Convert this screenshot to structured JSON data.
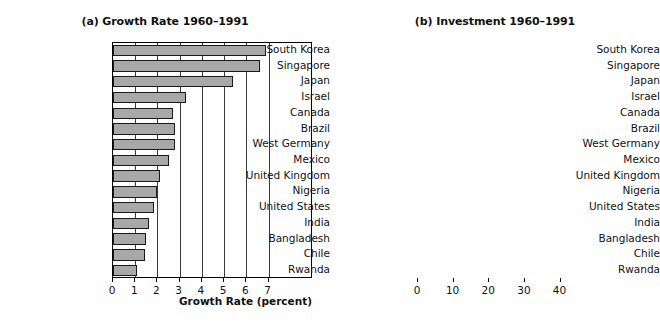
{
  "figure": {
    "background_color": "#ffffff",
    "panel_a_bar_color": "#a8a8a8",
    "panel_b_bar_color": "#e4e4e4"
  },
  "panels": {
    "a": {
      "title": "(a) Growth Rate 1960–1991",
      "xlabel": "Growth Rate (percent)",
      "ticks": [
        "0",
        "1",
        "2",
        "3",
        "4",
        "5",
        "6",
        "7"
      ]
    },
    "b": {
      "title": "(b) Investment 1960–1991",
      "xlabel": "Investment (percent of GDP)",
      "ticks": [
        "0",
        "10",
        "20",
        "30",
        "40"
      ]
    }
  },
  "chart_data": [
    {
      "type": "bar",
      "orientation": "horizontal",
      "title": "(a) Growth Rate 1960–1991",
      "xlabel": "Growth Rate (percent)",
      "ylabel": "",
      "xlim": [
        0,
        9
      ],
      "xticks": [
        0,
        1,
        2,
        3,
        4,
        5,
        6,
        7
      ],
      "grid": "vertical",
      "legend": "none",
      "bar_color": "#a8a8a8",
      "categories": [
        "South Korea",
        "Singapore",
        "Japan",
        "Israel",
        "Canada",
        "Brazil",
        "West Germany",
        "Mexico",
        "United Kingdom",
        "Nigeria",
        "United States",
        "India",
        "Bangladesh",
        "Chile",
        "Rwanda"
      ],
      "values": [
        6.9,
        6.6,
        5.4,
        3.3,
        2.7,
        2.8,
        2.8,
        2.5,
        2.1,
        2.0,
        1.85,
        1.6,
        1.5,
        1.45,
        1.1
      ]
    },
    {
      "type": "bar",
      "orientation": "horizontal",
      "title": "(b) Investment 1960–1991",
      "xlabel": "Investment (percent of GDP)",
      "ylabel": "",
      "xlim": [
        0,
        55
      ],
      "xticks": [
        0,
        10,
        20,
        30,
        40
      ],
      "grid": "vertical",
      "legend": "none",
      "bar_color": "#e4e4e4",
      "categories": [
        "South Korea",
        "Singapore",
        "Japan",
        "Israel",
        "Canada",
        "Brazil",
        "West Germany",
        "Mexico",
        "United Kingdom",
        "Nigeria",
        "United States",
        "India",
        "Bangladesh",
        "Chile",
        "Rwanda"
      ],
      "values": [
        23,
        30,
        33,
        25.6,
        22.3,
        18.3,
        26.5,
        16.3,
        18,
        12,
        21.1,
        15,
        4.2,
        19.4,
        4.2
      ]
    }
  ]
}
